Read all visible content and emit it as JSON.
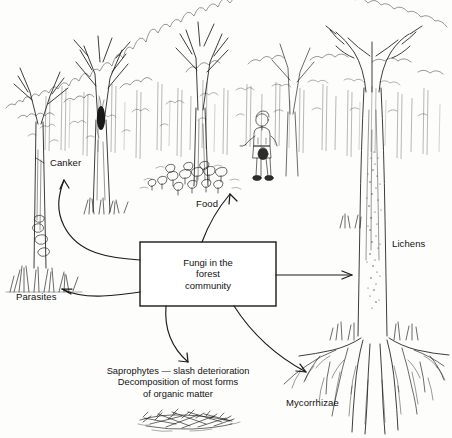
{
  "figure": {
    "kind": "forest-fungi-line-drawing",
    "background_color": "#fdfdfc",
    "ink_color": "#1a1a1a"
  },
  "center_box": {
    "line1": "Fungi in the",
    "line2": "forest",
    "line3": "community",
    "border_color": "#1a1a1a"
  },
  "labels": {
    "canker": "Canker",
    "parasites": "Parasites",
    "food": "Food",
    "lichens": "Lichens",
    "mycorrhizae": "Mycorrhizae"
  },
  "saprophytes_note": {
    "line1": "Saprophytes — slash deterioration",
    "line2": "Decomposition of most forms",
    "line3": "of organic matter"
  },
  "scene": {
    "canopy": "bare-branched-deciduous-forest",
    "understory": "hatched-background-trunks",
    "left_tree": "trunk-with-canker-and-bracket-fungi",
    "right_tree": "large-tree-with-lichen-patch-and-exposed-roots",
    "figure_person": "person-collecting-mushrooms",
    "mushroom-cluster": "cluster-of-mushrooms-on-forest-floor",
    "slash-pile": "pile-of-woody-slash-debris"
  }
}
